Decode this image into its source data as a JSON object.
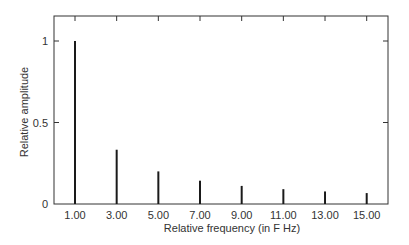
{
  "chart_data": {
    "type": "bar",
    "title": "",
    "xlabel": "Relative frequency (in F Hz)",
    "ylabel": "Relative amplitude",
    "categories": [
      "1.00",
      "3.00",
      "5.00",
      "7.00",
      "9.00",
      "11.00",
      "13.00",
      "15.00"
    ],
    "x": [
      1,
      3,
      5,
      7,
      9,
      11,
      13,
      15
    ],
    "values": [
      1.0,
      0.333,
      0.2,
      0.143,
      0.111,
      0.091,
      0.077,
      0.067
    ],
    "ylim": [
      0,
      1.15
    ],
    "yticks": [
      0,
      0.5,
      1
    ],
    "ytick_labels": [
      "0",
      "0.5",
      "1"
    ],
    "grid": false,
    "legend": null,
    "bar_style": "thin vertical spectral lines",
    "colors": {
      "bars": "#1a1a1a",
      "frame": "#333333",
      "text": "#333333"
    }
  }
}
